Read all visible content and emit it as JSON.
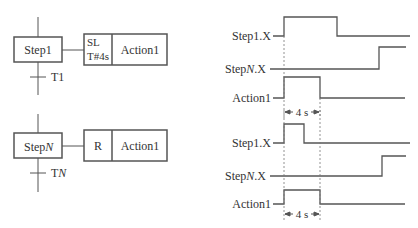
{
  "sfc": {
    "top": {
      "step_label": "Step1",
      "transition_label": "T1",
      "qualifier_line1": "SL",
      "qualifier_line2": "T#4s",
      "action_label": "Action1"
    },
    "bottom": {
      "step_label_prefix": "Step",
      "step_label_suffix": "N",
      "transition_label_prefix": "T",
      "transition_label_suffix": "N",
      "qualifier": "R",
      "action_label": "Action1"
    }
  },
  "timing": {
    "top": {
      "signals": [
        {
          "label_prefix": "Step1",
          "label_suffix": "",
          "label_end": ".X"
        },
        {
          "label_prefix": "Step",
          "label_suffix": "N",
          "label_end": ".X"
        },
        {
          "label_prefix": "Action1",
          "label_suffix": "",
          "label_end": ""
        }
      ],
      "duration_label": "4 s"
    },
    "bottom": {
      "signals": [
        {
          "label_prefix": "Step1",
          "label_suffix": "",
          "label_end": ".X"
        },
        {
          "label_prefix": "Step",
          "label_suffix": "N",
          "label_end": ".X"
        },
        {
          "label_prefix": "Action1",
          "label_suffix": "",
          "label_end": ""
        }
      ],
      "duration_label": "4 s"
    }
  },
  "colors": {
    "line": "#555555",
    "text": "#333333",
    "dotted": "#777777"
  }
}
